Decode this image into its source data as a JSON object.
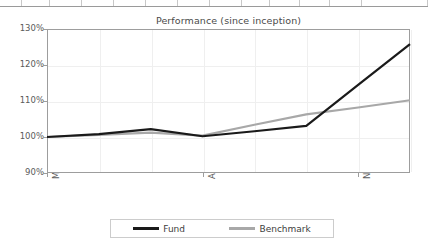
{
  "sheet_strip": {
    "cells": [
      "",
      "",
      "",
      "",
      "",
      "",
      "",
      "",
      "",
      "",
      "",
      "",
      ""
    ]
  },
  "chart_data": {
    "type": "line",
    "title": "Performance (since inception)",
    "xlabel": "",
    "ylabel": "",
    "ylim": [
      90,
      130
    ],
    "ytick_labels": [
      "130%",
      "120%",
      "110%",
      "100%",
      "90%"
    ],
    "ytick_values": [
      130,
      120,
      110,
      100,
      90
    ],
    "grid": true,
    "legend_position": "bottom",
    "x": [
      "May-04",
      "Jun-04",
      "Jul-04",
      "Aug-04",
      "Sep-04",
      "Oct-04",
      "Nov-04",
      "Dec-04"
    ],
    "xtick_labels": [
      "May-04",
      "Aug-04",
      "Nov-04"
    ],
    "xtick_indices": [
      0,
      3,
      6
    ],
    "series": [
      {
        "name": "Fund",
        "color": "#1a1a1a",
        "values": [
          100.0,
          100.8,
          102.2,
          100.2,
          101.6,
          103.1,
          114.5,
          125.8
        ]
      },
      {
        "name": "Benchmark",
        "color": "#a8a8a8",
        "values": [
          100.0,
          100.6,
          101.2,
          100.4,
          103.4,
          106.3,
          108.2,
          110.2
        ]
      }
    ]
  },
  "legend": {
    "entries": [
      {
        "label": "Fund",
        "color": "#1a1a1a"
      },
      {
        "label": "Benchmark",
        "color": "#a8a8a8"
      }
    ]
  }
}
